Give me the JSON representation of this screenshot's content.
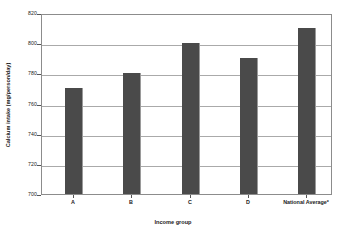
{
  "chart_data": {
    "type": "bar",
    "title": "",
    "categories": [
      "A",
      "B",
      "C",
      "D",
      "National Average*"
    ],
    "values": [
      770,
      780,
      800,
      790,
      810
    ],
    "xlabel": "Income group",
    "ylabel": "Calcium intake (mg/person/day)",
    "ylim": [
      700,
      820
    ],
    "yticks": [
      700,
      720,
      740,
      760,
      780,
      800,
      820
    ],
    "ytick_labels": [
      "700",
      "720",
      "740",
      "760",
      "780",
      "800",
      "820"
    ],
    "grid": true,
    "legend": "none",
    "series": [
      {
        "name": "Calcium intake",
        "values": [
          770,
          780,
          800,
          790,
          810
        ],
        "color": "#4a4a4a"
      }
    ],
    "bar_color": "#4a4a4a",
    "gridline_color": "#aaaaaa",
    "frame_color": "#8c8c8c",
    "background": "#ffffff"
  }
}
